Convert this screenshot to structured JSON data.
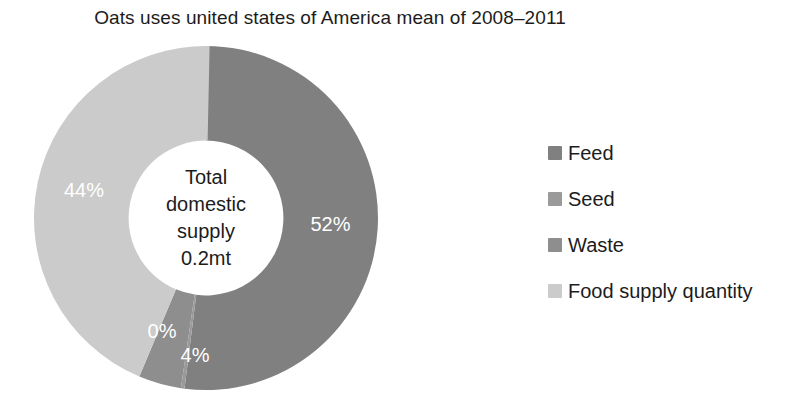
{
  "chart_data": {
    "type": "pie",
    "variant": "donut",
    "title": "Oats uses united states of America mean of 2008–2011",
    "categories": [
      "Feed",
      "Seed",
      "Waste",
      "Food supply quantity"
    ],
    "values": [
      52,
      0,
      4,
      44
    ],
    "value_unit": "%",
    "data_labels": [
      "52%",
      "0%",
      "4%",
      "44%"
    ],
    "colors": [
      "#808080",
      "#9a9a9a",
      "#8e8e8e",
      "#cbcbcb"
    ],
    "data_label_color": "#ffffff",
    "start_angle_deg": 0,
    "direction": "clockwise",
    "inner_radius_ratio": 0.45,
    "legend_position": "right",
    "legend_entries": [
      {
        "label": "Feed",
        "color": "#808080"
      },
      {
        "label": "Seed",
        "color": "#9a9a9a"
      },
      {
        "label": "Waste",
        "color": "#8e8e8e"
      },
      {
        "label": "Food supply quantity",
        "color": "#cbcbcb"
      }
    ],
    "center_annotation": {
      "lines": [
        "Total",
        "domestic",
        "supply",
        "0.2mt"
      ],
      "text": "Total domestic supply 0.2mt"
    },
    "xlabel": "",
    "ylabel": "",
    "grid": false,
    "background": "#ffffff"
  }
}
